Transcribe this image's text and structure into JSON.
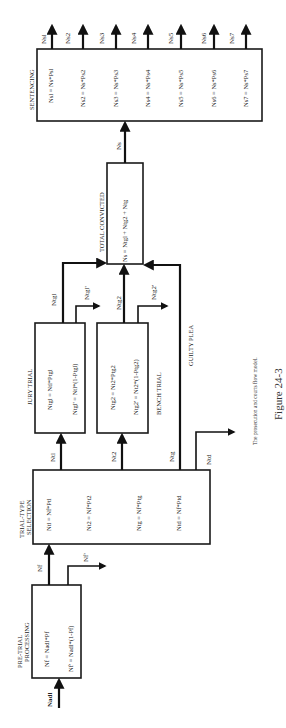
{
  "figure": {
    "caption": "The prosecution and courts flow model.",
    "number": "Figure 24-3",
    "orientation": "rotated 90° counter-clockwise"
  },
  "nodes": {
    "pre_trial": {
      "title_line1": "PRE-TRIAL",
      "title_line2": "PROCESSING",
      "equations": [
        "Nf = Nadl*Pf",
        "Nf' = Nadl*(1-Pf)"
      ]
    },
    "trial_type": {
      "title_line1": "TRIAL-TYPE",
      "title_line2": "SELECTION",
      "equations": [
        "Ntl = Nf*Ptl",
        "Nt2 = Nf*Pt2",
        "Ntg = Nf*Ptg",
        "Ntd = Nf*Ptd"
      ]
    },
    "jury_trial": {
      "title": "JURY TRIAL",
      "equations": [
        "Ntgl = Ntl*Ptgl",
        "Ntgl' = Ntl*(1-Ptgl)"
      ]
    },
    "bench_trial": {
      "title": "BENCH TRIAL",
      "equations": [
        "Ntg2 = Nt2*Ptg2",
        "Ntg2' = Nt2*(1-Ptg2)"
      ]
    },
    "total_convicted": {
      "title": "TOTAL CONVICTED",
      "equations": [
        "Ns = Ntgl + Ntg2 + Ntg"
      ]
    },
    "sentencing": {
      "title": "SENTENCING",
      "equations": [
        "Nsl = Ns*Psl",
        "Ns2 = Ns*Ps2",
        "Ns3 = Ns*Ps3",
        "Ns4 = Ns*Ps4",
        "Ns5 = Ns*Ps5",
        "Ns6 = Ns*Ps6",
        "Ns7 = Ns*Ps7"
      ]
    }
  },
  "flows": {
    "input": "Nadl",
    "pre_to_trialtype": "Nf",
    "pre_out": "Nf'",
    "tt_to_jury": "Ntl",
    "tt_to_bench": "Nt2",
    "tt_guilty": "Ntg",
    "tt_out": "Ntd",
    "guilty_plea_label": "GUILTY PLEA",
    "jury_to_total": "Ntgl",
    "jury_out": "Ntgl'",
    "bench_to_total": "Ntg2",
    "bench_out": "Ntg2'",
    "total_to_sentencing": "Ns",
    "sentencing_outputs": [
      "Nsl",
      "Ns2",
      "Ns3",
      "Ns4",
      "Ns5",
      "Ns6",
      "Ns7"
    ]
  },
  "colors": {
    "line": "#111111",
    "text": "#222222",
    "background": "#ffffff"
  }
}
